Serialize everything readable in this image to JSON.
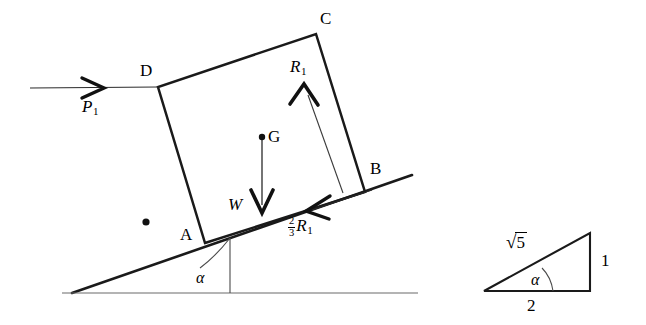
{
  "figure": {
    "stroke_color": "#1a1a1a",
    "thin_stroke_color": "#555555",
    "background": "#ffffff"
  },
  "block": {
    "vertices": [
      {
        "name": "A",
        "label": "A",
        "x": 205,
        "y": 243
      },
      {
        "name": "B",
        "label": "B",
        "x": 365,
        "y": 192
      },
      {
        "name": "C",
        "label": "C",
        "x": 316,
        "y": 34
      },
      {
        "name": "D",
        "label": "D",
        "x": 158,
        "y": 87
      }
    ],
    "centroid": {
      "label": "G",
      "x": 262,
      "y": 137
    }
  },
  "forces": [
    {
      "id": "P1",
      "label": "P",
      "subscript": "1",
      "description": "applied horizontal force at D",
      "direction": "horizontal-right",
      "tail": {
        "x": 30,
        "y": 88
      },
      "tip": {
        "x": 158,
        "y": 87
      }
    },
    {
      "id": "W",
      "label": "W",
      "subscript": "",
      "description": "weight acting downward through G",
      "direction": "vertical-down",
      "tail": {
        "x": 262,
        "y": 140
      },
      "tip": {
        "x": 262,
        "y": 212
      }
    },
    {
      "id": "R1",
      "label": "R",
      "subscript": "1",
      "description": "normal reaction on face BC",
      "direction": "up-left",
      "tail": {
        "x": 343,
        "y": 193
      },
      "tip": {
        "x": 304,
        "y": 84
      }
    },
    {
      "id": "twothirdsR1",
      "label": "R",
      "subscript": "1",
      "coefficient_numerator": "2",
      "coefficient_denominator": "3",
      "description": "friction force along the incline at the base",
      "direction": "down-left-along-incline",
      "tail": {
        "x": 372,
        "y": 190
      },
      "tip": {
        "x": 306,
        "y": 211
      }
    }
  ],
  "incline": {
    "angle_label": "α",
    "apex": {
      "x": 72,
      "y": 293
    },
    "upper_end": {
      "x": 412,
      "y": 175
    },
    "ground_left": {
      "x": 62,
      "y": 293
    },
    "ground_right": {
      "x": 418,
      "y": 293
    },
    "angle_vertex": {
      "x": 230,
      "y": 237
    }
  },
  "marker_dot": {
    "description": "reference point inside incline",
    "x": 146,
    "y": 222
  },
  "reference_triangle": {
    "hypotenuse_label": "√5",
    "hypotenuse_radicand": "5",
    "base_label": "2",
    "height_label": "1",
    "angle_label": "α",
    "apex_left": {
      "x": 484,
      "y": 291
    },
    "corner_right": {
      "x": 590,
      "y": 291
    },
    "corner_top": {
      "x": 590,
      "y": 233
    }
  }
}
